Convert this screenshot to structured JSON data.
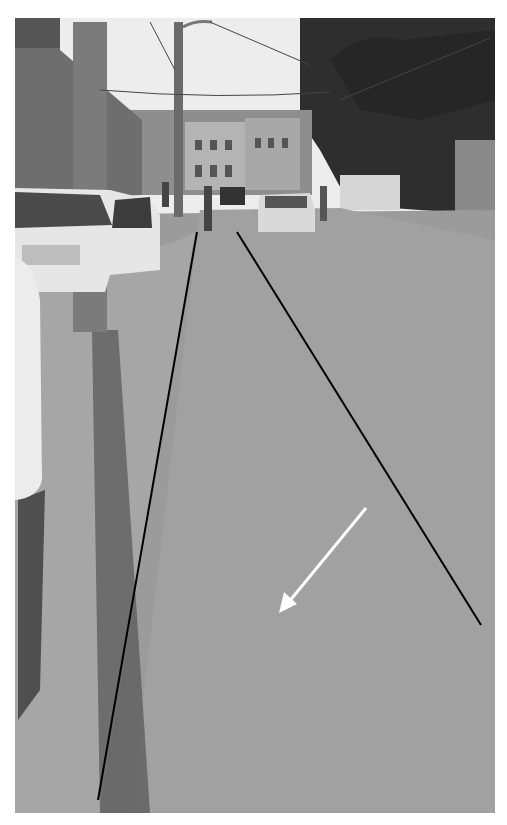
{
  "image": {
    "description": "Grayscale street photograph with two black guide lines marking road edges and a white arrow pointing down-left",
    "palette": {
      "sky": "#eeeeee",
      "road": "#9a9a9a",
      "shadow": "#3a3a3a",
      "buildings": "#7a7a7a",
      "trees": "#2c2c2c",
      "annotation_line": "#000000",
      "arrow": "#ffffff"
    },
    "annotations": {
      "left_line": {
        "x1": 197,
        "y1": 232,
        "x2": 98,
        "y2": 800
      },
      "right_line": {
        "x1": 237,
        "y1": 232,
        "x2": 481,
        "y2": 625
      },
      "arrow": {
        "x1": 366,
        "y1": 508,
        "x2": 281,
        "y2": 611
      }
    }
  }
}
